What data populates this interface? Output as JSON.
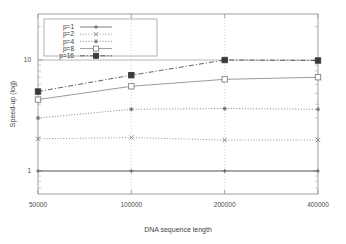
{
  "chart_data": {
    "type": "line",
    "title": "",
    "xlabel": "DNA sequence length",
    "ylabel": "Speed-up (log)",
    "yscale": "log",
    "xscale": "category",
    "grid": true,
    "legend_position": "top-left",
    "categories": [
      "50000",
      "100000",
      "200000",
      "400000"
    ],
    "xtick_labels": [
      "50000",
      "100000",
      "200000",
      "400000"
    ],
    "ytick_labels": [
      "1",
      "10"
    ],
    "ytick_values": [
      1,
      10
    ],
    "ylim": [
      0.62,
      26
    ],
    "series": [
      {
        "name": "p=1",
        "marker": "plus",
        "linestyle": "solid",
        "color": "#5a5a5a",
        "values": [
          1.0,
          1.0,
          1.0,
          1.0
        ]
      },
      {
        "name": "p=2",
        "marker": "cross",
        "linestyle": "dotted",
        "color": "#777777",
        "values": [
          1.95,
          2.0,
          1.9,
          1.9
        ]
      },
      {
        "name": "p=4",
        "marker": "star",
        "linestyle": "dotted",
        "color": "#666666",
        "values": [
          3.0,
          3.6,
          3.65,
          3.6
        ]
      },
      {
        "name": "p=8",
        "marker": "open-square",
        "linestyle": "solid",
        "color": "#808080",
        "values": [
          4.4,
          5.8,
          6.7,
          7.0
        ]
      },
      {
        "name": "p=16",
        "marker": "filled-square",
        "linestyle": "dashdot",
        "color": "#3a3a3a",
        "values": [
          5.2,
          7.3,
          10.0,
          9.9
        ]
      }
    ]
  },
  "legend": {
    "entries": [
      {
        "label": "p=1"
      },
      {
        "label": "p=2"
      },
      {
        "label": "p=4"
      },
      {
        "label": "p=8"
      },
      {
        "label": "p=16"
      }
    ]
  }
}
